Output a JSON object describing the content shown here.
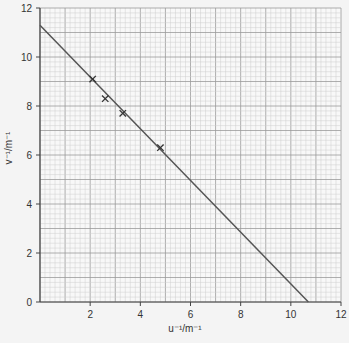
{
  "chart_data": {
    "type": "scatter",
    "title": "",
    "xlabel": "u⁻¹/m⁻¹",
    "ylabel": "v⁻¹/m⁻¹",
    "xlim": [
      0,
      12
    ],
    "ylim": [
      0,
      12
    ],
    "x_ticks": [
      2,
      4,
      6,
      8,
      10,
      12
    ],
    "y_ticks": [
      0,
      2,
      4,
      6,
      8,
      10,
      12
    ],
    "grid": true,
    "grid_minor_step": 0.2,
    "grid_major_step": 1,
    "series": [
      {
        "name": "measurements",
        "marker": "x",
        "points": [
          {
            "x": 2.1,
            "y": 9.1
          },
          {
            "x": 2.6,
            "y": 8.3
          },
          {
            "x": 3.3,
            "y": 7.7
          },
          {
            "x": 4.8,
            "y": 6.3
          }
        ]
      }
    ],
    "best_fit_line": {
      "from": {
        "x": 0,
        "y": 11.3
      },
      "to": {
        "x": 10.7,
        "y": 0
      }
    }
  },
  "labels": {
    "xlabel": "u⁻¹/m⁻¹",
    "ylabel": "v⁻¹/m⁻¹",
    "origin": "0"
  }
}
